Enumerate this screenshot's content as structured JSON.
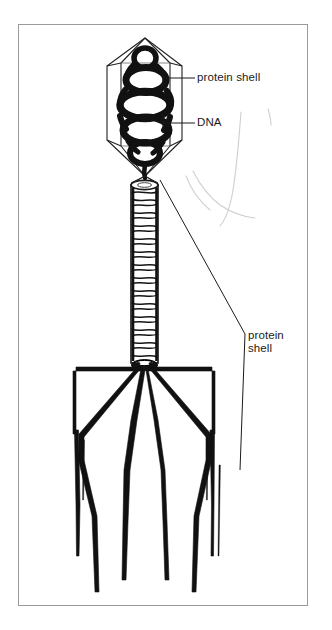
{
  "figure": {
    "background_color": "#ffffff",
    "frame_color": "#9a9a9a",
    "ink_color": "#111111",
    "pencil_color": "#c9c9c9"
  },
  "labels": {
    "head_shell": {
      "text": "protein shell",
      "target": "capsid-outline"
    },
    "dna": {
      "text": "DNA",
      "target": "dna-coil"
    },
    "tail_shell": {
      "line1": "protein",
      "line2": "shell",
      "target": "tail-sheath"
    }
  },
  "parts": {
    "capsid": "hexagonal-protein-head",
    "dna_coil": "coiled-dna-strand",
    "tail_sheath": "striated-tail-tube",
    "baseplate": "baseplate-hub",
    "tail_fibers": "six-tail-fiber-legs"
  }
}
